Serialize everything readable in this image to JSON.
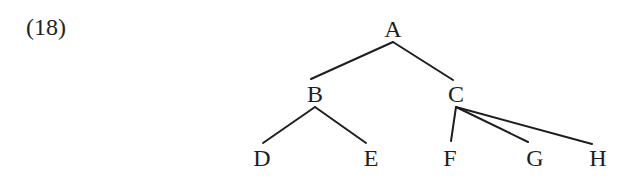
{
  "example": {
    "number_label": "(18)"
  },
  "tree": {
    "nodes": [
      {
        "id": "A",
        "label": "A",
        "x": 393,
        "y": 37
      },
      {
        "id": "B",
        "label": "B",
        "x": 315,
        "y": 102
      },
      {
        "id": "C",
        "label": "C",
        "x": 456,
        "y": 102
      },
      {
        "id": "D",
        "label": "D",
        "x": 262,
        "y": 166
      },
      {
        "id": "E",
        "label": "E",
        "x": 371,
        "y": 166
      },
      {
        "id": "F",
        "label": "F",
        "x": 450,
        "y": 166
      },
      {
        "id": "G",
        "label": "G",
        "x": 535,
        "y": 166
      },
      {
        "id": "H",
        "label": "H",
        "x": 598,
        "y": 166
      }
    ],
    "edges": [
      {
        "from": "A",
        "to": "B",
        "x1": 393,
        "y1": 42,
        "x2": 311,
        "y2": 79
      },
      {
        "from": "A",
        "to": "C",
        "x1": 393,
        "y1": 42,
        "x2": 453,
        "y2": 80
      },
      {
        "from": "B",
        "to": "D",
        "x1": 315,
        "y1": 107,
        "x2": 263,
        "y2": 143
      },
      {
        "from": "B",
        "to": "E",
        "x1": 315,
        "y1": 107,
        "x2": 366,
        "y2": 143
      },
      {
        "from": "C",
        "to": "F",
        "x1": 456,
        "y1": 107,
        "x2": 451,
        "y2": 141
      },
      {
        "from": "C",
        "to": "G",
        "x1": 456,
        "y1": 107,
        "x2": 528,
        "y2": 142
      },
      {
        "from": "C",
        "to": "H",
        "x1": 456,
        "y1": 107,
        "x2": 592,
        "y2": 144
      }
    ]
  }
}
